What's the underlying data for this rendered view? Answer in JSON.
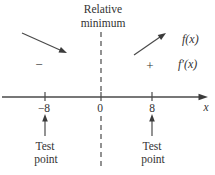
{
  "figure": {
    "header": {
      "line1": "Relative",
      "line2": "minimum"
    },
    "signs": {
      "minus": "−",
      "plus": "+"
    },
    "function_labels": {
      "f": "f(x)",
      "f_prime": "f′(x)"
    },
    "axis": {
      "tick_labels": [
        "−8",
        "0",
        "8"
      ],
      "axis_label": "x"
    },
    "test_points": {
      "line1": "Test",
      "line2": "point"
    },
    "icons": {
      "decreasing_arrow": "arrow-down-right",
      "increasing_arrow": "arrow-up-right",
      "test_point_arrow": "arrow-up",
      "axis_arrow": "arrow-right"
    },
    "colors": {
      "ink": "#333333",
      "line": "#4a4a4a",
      "background": "#ffffff"
    }
  }
}
